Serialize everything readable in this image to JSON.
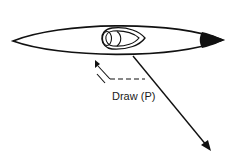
{
  "diagram": {
    "labels": {
      "draw_stroke": "Draw (P)"
    },
    "colors": {
      "ink": "#111111",
      "background": "#ffffff"
    },
    "elements": [
      {
        "name": "kayak-hull",
        "shape": "elongated-lens"
      },
      {
        "name": "cockpit",
        "shape": "oval-with-seat"
      },
      {
        "name": "stern-tip",
        "shape": "filled-black-tip"
      },
      {
        "name": "force-arrow",
        "direction": "down-right"
      },
      {
        "name": "draw-arrow",
        "direction": "up-left",
        "style": "dashed"
      }
    ]
  }
}
